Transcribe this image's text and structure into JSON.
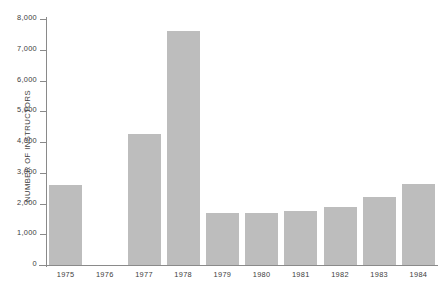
{
  "chart_data": {
    "type": "bar",
    "title": "",
    "xlabel": "",
    "ylabel": "NUMBER OF INSTRUCTORS",
    "categories": [
      "1975",
      "1976",
      "1977",
      "1978",
      "1979",
      "1980",
      "1981",
      "1982",
      "1983",
      "1984"
    ],
    "values": [
      2600,
      0,
      4250,
      7600,
      1700,
      1700,
      1750,
      1900,
      2200,
      2650
    ],
    "ylim": [
      0,
      8000
    ],
    "ytick_values": [
      0,
      1000,
      2000,
      3000,
      4000,
      5000,
      6000,
      7000,
      8000
    ],
    "ytick_labels": [
      "0",
      "1,000",
      "2,000",
      "3,000",
      "4,000",
      "5,000",
      "6,000",
      "7,000",
      "8,000"
    ],
    "grid": false,
    "legend": null,
    "bar_color": "#bdbdbd",
    "axis_color": "#8a8a8a",
    "text_color": "#3d3d3d",
    "background": "#ffffff"
  }
}
